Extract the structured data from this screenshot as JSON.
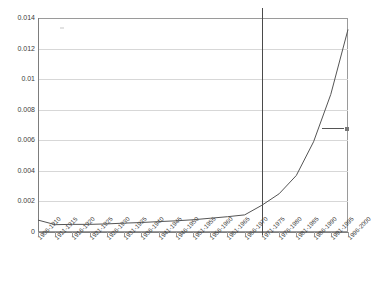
{
  "chart_data": {
    "type": "line",
    "title": "",
    "subtitle": "",
    "xlabel": "",
    "ylabel": "",
    "ylim": [
      0,
      0.014
    ],
    "ytick_labels": [
      "0.014",
      "0.012",
      "0.01",
      "0.008",
      "0.006",
      "0.004",
      "0.002",
      "0"
    ],
    "ytick_values": [
      0.014,
      0.012,
      0.01,
      0.008,
      0.006,
      0.004,
      0.002,
      0
    ],
    "grid": true,
    "legend_position": "right-inside",
    "legend_entries": [
      {
        "label": "",
        "marker": "line-with-square-endpoint",
        "color": "#555555"
      }
    ],
    "annotations": [
      {
        "type": "vertical-reference-line",
        "at_category": "1971-1975",
        "color": "#4a4a4a"
      }
    ],
    "categories": [
      "1906-1910",
      "1911-1915",
      "1916-1920",
      "1921-1925",
      "1926-1930",
      "1931-1935",
      "1936-1940",
      "1941-1945",
      "1946-1950",
      "1951-1955",
      "1956-1960",
      "1961-1965",
      "1966-1970",
      "1971-1975",
      "1976-1980",
      "1981-1985",
      "1986-1990",
      "1991-1995",
      "1996-2000"
    ],
    "series": [
      {
        "name": "",
        "color": "#555555",
        "values": [
          0.00078,
          0.00048,
          0.0005,
          0.0005,
          0.00053,
          0.00058,
          0.00062,
          0.00068,
          0.00073,
          0.0008,
          0.0009,
          0.001,
          0.00112,
          0.00175,
          0.0025,
          0.0037,
          0.0059,
          0.009,
          0.01325
        ]
      }
    ]
  }
}
